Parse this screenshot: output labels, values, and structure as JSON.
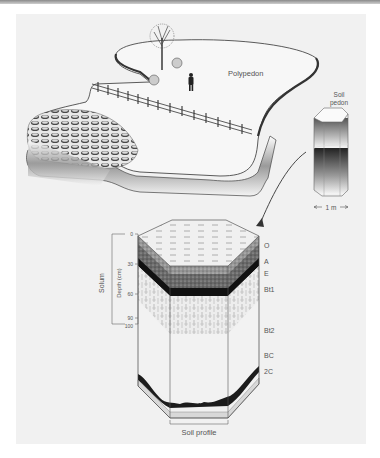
{
  "figure": {
    "landscape_label": "Polypedon",
    "pedon_label_line1": "Soil",
    "pedon_label_line2": "pedon",
    "scale_label": "1 m",
    "profile_label": "Soil profile",
    "solum_label": "Solum",
    "depth_axis_label": "Depth (cm)",
    "depth_ticks": [
      "0",
      "30",
      "60",
      "90",
      "100"
    ],
    "horizons": [
      "O",
      "A",
      "E",
      "Bt1",
      "Bt2",
      "BC",
      "2C"
    ]
  }
}
